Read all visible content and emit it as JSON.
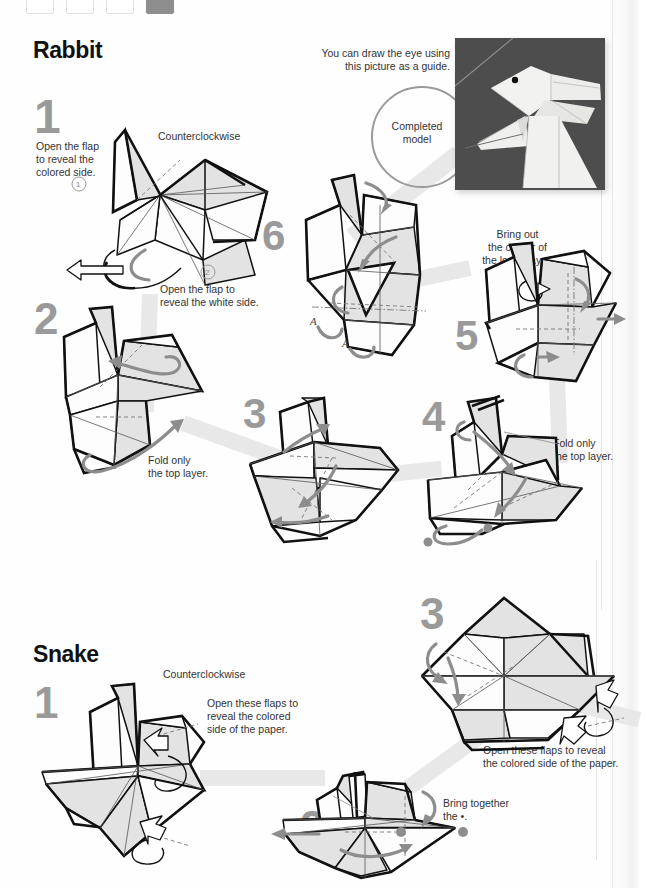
{
  "page": {
    "width": 639,
    "height": 888,
    "background": "#fefefe",
    "type": "origami instruction book page"
  },
  "swatches": {
    "name": "chapter-color-tabs",
    "count": 4,
    "active_index": 3,
    "active_color": "#8e8e8e",
    "inactive_color": "#ffffff"
  },
  "colors": {
    "step_number": "#9a9a9a",
    "heading": "#111111",
    "caption": "#333333",
    "paper_colored_side": "#e3e3e3",
    "paper_white_side": "#fdfdfd",
    "ink": "#111111",
    "flow_ribbon": "#e8e8e8",
    "gray_arrow": "#8d8d8d",
    "photo_background": "#4d4d4d"
  },
  "sections": [
    {
      "id": "rabbit",
      "title": "Rabbit",
      "steps": [
        {
          "number": "1",
          "captions": [
            "Open the flap\nto reveal the\ncolored side.",
            "Counterclockwise",
            "Open the flap to\nreveal the white side."
          ],
          "markers": [
            "1",
            "2"
          ]
        },
        {
          "number": "2",
          "captions": [
            "Fold only\nthe top layer."
          ]
        },
        {
          "number": "3",
          "captions": []
        },
        {
          "number": "4",
          "captions": [
            "Fold only\nthe top layer."
          ]
        },
        {
          "number": "5",
          "captions": [
            "Bring out\nthe corner of\nthe lower layer."
          ]
        },
        {
          "number": "6",
          "captions": [],
          "markers": [
            "A",
            "A"
          ]
        }
      ],
      "completed_model": {
        "note": "You can draw the eye using\nthis picture as a guide.",
        "circle_label": "Completed\nmodel",
        "photo_alt": "completed white origami rabbit on dark gray background"
      }
    },
    {
      "id": "snake",
      "title": "Snake",
      "steps": [
        {
          "number": "1",
          "captions": [
            "Counterclockwise",
            "Open these flaps to\nreveal the colored\nside of the paper."
          ]
        },
        {
          "number": "2",
          "captions": [
            "Bring together\nthe •."
          ]
        },
        {
          "number": "3",
          "captions": [
            "Open these flaps to reveal\nthe colored side of the paper."
          ]
        }
      ]
    }
  ],
  "caption_texts": {
    "rabbit_1a": "Open the flap",
    "rabbit_1b": "to reveal the",
    "rabbit_1c": "colored side.",
    "rabbit_ccw": "Counterclockwise",
    "rabbit_1d": "Open the flap to",
    "rabbit_1e": "reveal the white side.",
    "photo_note_1": "You can draw the eye using",
    "photo_note_2": "this picture as a guide.",
    "completed_1": "Completed",
    "completed_2": "model",
    "rabbit_2a": "Fold only",
    "rabbit_2b": "the top layer.",
    "rabbit_4a": "Fold only",
    "rabbit_4b": "the top layer.",
    "rabbit_5a": "Bring out",
    "rabbit_5b": "the corner of",
    "rabbit_5c": "the lower layer.",
    "snake_ccw": "Counterclockwise",
    "snake_1a": "Open these flaps to",
    "snake_1b": "reveal the colored",
    "snake_1c": "side of the paper.",
    "snake_2a": "Bring together",
    "snake_2b": "the •.",
    "snake_3a": "Open these flaps to reveal",
    "snake_3b": "the colored side of the paper."
  },
  "step_numbers": {
    "rabbit_1": "1",
    "rabbit_2": "2",
    "rabbit_3": "3",
    "rabbit_4": "4",
    "rabbit_5": "5",
    "rabbit_6": "6",
    "snake_1": "1",
    "snake_2": "2",
    "snake_3": "3"
  },
  "markers": {
    "circled_1": "1",
    "circled_2": "2",
    "letter_a1": "A",
    "letter_a2": "A"
  },
  "titles": {
    "rabbit": "Rabbit",
    "snake": "Snake"
  }
}
